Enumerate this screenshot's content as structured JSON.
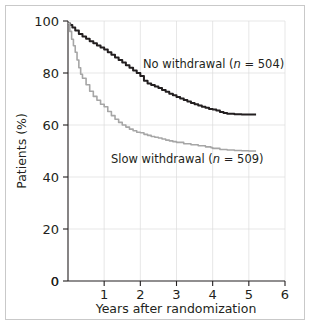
{
  "figure": {
    "background_color": "#ffffff",
    "border_color": "#c9c9c9"
  },
  "chart_data": {
    "type": "line",
    "title": "",
    "subtitle": "",
    "xlabel": "Years after randomization",
    "ylabel": "Patients (%)",
    "xlim": [
      0,
      6
    ],
    "ylim": [
      0,
      100
    ],
    "xticks": [
      "0",
      "1",
      "2",
      "3",
      "4",
      "5",
      "6"
    ],
    "xtick_values": [
      0,
      1,
      2,
      3,
      4,
      5,
      6
    ],
    "yticks": [
      "0",
      "20",
      "40",
      "60",
      "80",
      "100"
    ],
    "ytick_values": [
      0,
      20,
      40,
      60,
      80,
      100
    ],
    "grid": true,
    "grid_color": "#dcdcdc",
    "legend_position": "inline-annotation",
    "annotations": [
      {
        "name": "no-withdrawal-label",
        "text_main": "No withdrawal (",
        "text_italic": "n",
        "text_tail": " = 504)",
        "full_text": "No withdrawal (n = 504)",
        "x_px": 143,
        "y_px": 68
      },
      {
        "name": "slow-withdrawal-label",
        "text_main": "Slow withdrawal (",
        "text_italic": "n",
        "text_tail": " = 509)",
        "full_text": "Slow withdrawal (n = 509)",
        "x_px": 111,
        "y_px": 163
      }
    ],
    "series": [
      {
        "name": "No withdrawal (n = 504)",
        "short_name": "No withdrawal",
        "n": 504,
        "color": "#231f20",
        "line_width": 2.0,
        "x": [
          0.0,
          0.06,
          0.12,
          0.2,
          0.3,
          0.4,
          0.5,
          0.6,
          0.7,
          0.8,
          0.9,
          1.0,
          1.1,
          1.2,
          1.3,
          1.4,
          1.5,
          1.6,
          1.7,
          1.8,
          1.9,
          2.0,
          2.1,
          2.2,
          2.3,
          2.4,
          2.5,
          2.6,
          2.7,
          2.8,
          2.9,
          3.0,
          3.1,
          3.2,
          3.3,
          3.4,
          3.5,
          3.6,
          3.7,
          3.8,
          3.9,
          4.0,
          4.1,
          4.2,
          4.3,
          4.4,
          4.6,
          4.8,
          5.0,
          5.2
        ],
        "y": [
          99.0,
          98.5,
          97.5,
          96.3,
          95.0,
          94.0,
          93.2,
          92.2,
          91.4,
          90.6,
          89.8,
          89.0,
          88.0,
          87.0,
          86.0,
          85.0,
          84.0,
          83.0,
          82.0,
          81.0,
          80.0,
          78.8,
          77.0,
          76.0,
          75.4,
          74.8,
          74.2,
          73.5,
          72.8,
          72.0,
          71.4,
          70.8,
          70.2,
          69.6,
          69.0,
          68.5,
          68.0,
          67.5,
          67.0,
          66.6,
          66.2,
          66.0,
          65.6,
          65.0,
          64.6,
          64.3,
          64.1,
          64.0,
          64.0,
          64.0
        ],
        "final_value": 64.0
      },
      {
        "name": "Slow withdrawal (n = 509)",
        "short_name": "Slow withdrawal",
        "n": 509,
        "color": "#a6a6a6",
        "line_width": 1.6,
        "x": [
          0.0,
          0.05,
          0.1,
          0.15,
          0.2,
          0.25,
          0.3,
          0.35,
          0.4,
          0.5,
          0.6,
          0.7,
          0.8,
          0.9,
          1.0,
          1.1,
          1.2,
          1.3,
          1.4,
          1.5,
          1.6,
          1.7,
          1.8,
          1.9,
          2.0,
          2.1,
          2.2,
          2.3,
          2.4,
          2.5,
          2.6,
          2.7,
          2.8,
          2.9,
          3.0,
          3.2,
          3.4,
          3.6,
          3.8,
          3.95,
          4.0,
          4.2,
          4.4,
          4.6,
          4.8,
          5.0,
          5.2
        ],
        "y": [
          99.0,
          96.0,
          93.0,
          90.5,
          88.0,
          85.0,
          82.0,
          79.5,
          78.0,
          75.5,
          73.0,
          71.0,
          69.5,
          68.0,
          67.0,
          65.2,
          63.6,
          62.2,
          61.0,
          60.0,
          59.2,
          58.4,
          57.8,
          57.2,
          57.0,
          56.4,
          56.0,
          55.6,
          55.3,
          55.0,
          54.6,
          54.2,
          53.9,
          53.6,
          53.3,
          52.8,
          52.4,
          52.0,
          51.6,
          51.3,
          51.0,
          50.6,
          50.4,
          50.2,
          50.1,
          50.0,
          50.0
        ],
        "final_value": 50.0
      }
    ]
  }
}
